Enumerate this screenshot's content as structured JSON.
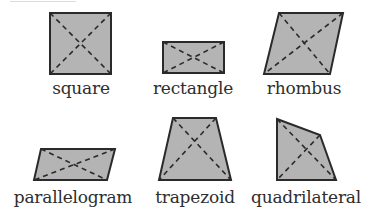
{
  "colors": {
    "fill": "#b4b4b4",
    "stroke": "#2a2a2a",
    "diagonal": "#2a2a2a",
    "text": "#2e2e2e"
  },
  "shapes": [
    {
      "name": "square",
      "label": "square",
      "points": [
        [
          50,
          13
        ],
        [
          111,
          13
        ],
        [
          111,
          74
        ],
        [
          50,
          74
        ]
      ],
      "label_pos": [
        81,
        80
      ]
    },
    {
      "name": "rectangle",
      "label": "rectangle",
      "points": [
        [
          163,
          42
        ],
        [
          224,
          42
        ],
        [
          224,
          73
        ],
        [
          163,
          73
        ]
      ],
      "label_pos": [
        193,
        80
      ]
    },
    {
      "name": "rhombus",
      "label": "rhombus",
      "points": [
        [
          279,
          13
        ],
        [
          343,
          13
        ],
        [
          330,
          74
        ],
        [
          264,
          74
        ]
      ],
      "label_pos": [
        304,
        80
      ]
    },
    {
      "name": "parallelogram",
      "label": "parallelogram",
      "points": [
        [
          41,
          149
        ],
        [
          115,
          149
        ],
        [
          107,
          180
        ],
        [
          34,
          180
        ]
      ],
      "label_pos": [
        73,
        189
      ]
    },
    {
      "name": "trapezoid",
      "label": "trapezoid",
      "points": [
        [
          173,
          118
        ],
        [
          216,
          118
        ],
        [
          231,
          180
        ],
        [
          159,
          180
        ]
      ],
      "label_pos": [
        195,
        189
      ]
    },
    {
      "name": "quadrilateral",
      "label": "quadrilateral",
      "points": [
        [
          277,
          119
        ],
        [
          320,
          135
        ],
        [
          336,
          180
        ],
        [
          277,
          180
        ]
      ],
      "label_pos": [
        306,
        189
      ]
    }
  ]
}
